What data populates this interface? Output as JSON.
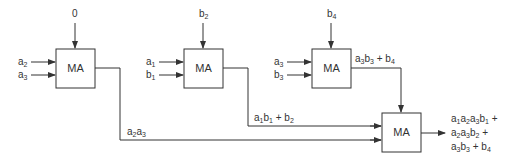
{
  "diagram": {
    "type": "multiply-add tree",
    "blocks": [
      {
        "id": "ma1",
        "label": "MA",
        "inputs": {
          "top": "0",
          "left": [
            "a2",
            "a3"
          ]
        },
        "output": "a2a3"
      },
      {
        "id": "ma2",
        "label": "MA",
        "inputs": {
          "top": "b2",
          "left": [
            "a1",
            "b1"
          ]
        },
        "output": "a1b1 + b2"
      },
      {
        "id": "ma3",
        "label": "MA",
        "inputs": {
          "top": "b4",
          "left": [
            "a3",
            "b3"
          ]
        },
        "output": "a3b3 + b4"
      },
      {
        "id": "ma4",
        "label": "MA",
        "inputs": {
          "top": "a3b3 + b4",
          "left": [
            "a1b1 + b2",
            "a2a3"
          ]
        },
        "output": "a1a2a3b1 + a2a3b2 + a3b3 + b4"
      }
    ],
    "labels": {
      "ma": "MA",
      "zero": "0",
      "final_line1": "+",
      "final_line2": "+",
      "final_line3": "+"
    }
  }
}
